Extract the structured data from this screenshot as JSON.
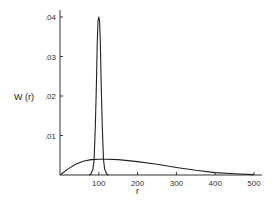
{
  "chart_data": {
    "type": "line",
    "title": "",
    "xlabel": "r",
    "ylabel": "W (r)",
    "xlim": [
      0,
      520
    ],
    "ylim": [
      0,
      0.042
    ],
    "grid": false,
    "legend": "none",
    "x_ticks": [
      100,
      200,
      300,
      400,
      500
    ],
    "x_tick_labels": [
      "100",
      "200",
      "300",
      "400",
      "500"
    ],
    "y_ticks": [
      0.01,
      0.02,
      0.03,
      0.04
    ],
    "y_tick_labels": [
      ".01",
      ".02",
      ".03",
      ".04"
    ],
    "series": [
      {
        "name": "narrow peak",
        "x": [
          75,
          80,
          85,
          88,
          91,
          94,
          96,
          98,
          100,
          102,
          104,
          106,
          109,
          112,
          115,
          120,
          125
        ],
        "y": [
          0,
          0.0003,
          0.0015,
          0.004,
          0.012,
          0.024,
          0.033,
          0.039,
          0.04,
          0.039,
          0.033,
          0.024,
          0.012,
          0.004,
          0.0015,
          0.0003,
          0
        ]
      },
      {
        "name": "broad distribution",
        "x": [
          0,
          20,
          40,
          60,
          80,
          100,
          120,
          150,
          200,
          250,
          300,
          350,
          400,
          450,
          500
        ],
        "y": [
          0,
          0.0015,
          0.0027,
          0.0035,
          0.0039,
          0.004,
          0.004,
          0.0039,
          0.0034,
          0.0027,
          0.0019,
          0.0012,
          0.0006,
          0.0003,
          0.0001
        ]
      }
    ]
  },
  "labels": {
    "ylabel": "W (r)",
    "xlabel": "r",
    "y_ticks": [
      ".04",
      ".03",
      ".02",
      ".01"
    ],
    "x_ticks": [
      "100",
      "200",
      "300",
      "400",
      "500"
    ]
  }
}
